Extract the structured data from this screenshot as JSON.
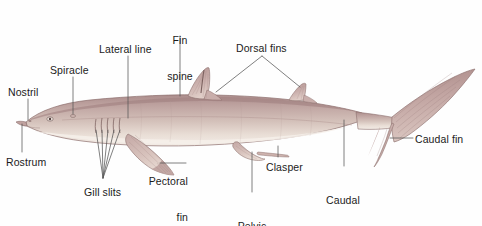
{
  "figure": {
    "background_color": "#fefefe",
    "label_color": "#1b1b1b",
    "leader_color": "#555555",
    "body_colors": {
      "dorsal": "#b79a98",
      "mid": "#c9b3ae",
      "ventral": "#efe7e0",
      "outline": "#8c6f6d",
      "fin": "#c3a6a3",
      "fin_shadow": "#a98b89"
    }
  },
  "labels": [
    {
      "id": "nostril",
      "text": "Nostril",
      "line2": "",
      "align": "left",
      "x": 8,
      "y": 86
    },
    {
      "id": "rostrum",
      "text": "Rostrum",
      "line2": "",
      "align": "left",
      "x": 6,
      "y": 156
    },
    {
      "id": "spiracle",
      "text": "Spiracle",
      "line2": "",
      "align": "left",
      "x": 50,
      "y": 64
    },
    {
      "id": "lateral-line",
      "text": "Lateral line",
      "line2": "",
      "align": "left",
      "x": 99,
      "y": 43
    },
    {
      "id": "gill-slits",
      "text": "Gill slits",
      "line2": "",
      "align": "center",
      "x": 84,
      "y": 186
    },
    {
      "id": "fin-spine",
      "text": "Fin",
      "line2": "spine",
      "align": "center",
      "x": 163,
      "y": 10
    },
    {
      "id": "dorsal-fins",
      "text": "Dorsal fins",
      "line2": "",
      "align": "left",
      "x": 236,
      "y": 42
    },
    {
      "id": "pectoral-fin",
      "text": "Pectoral",
      "line2": "fin",
      "align": "right",
      "x": 188,
      "y": 151
    },
    {
      "id": "pelvic-fin",
      "text": "Pelvic",
      "line2": "fin",
      "align": "center",
      "x": 243,
      "y": 196
    },
    {
      "id": "clasper",
      "text": "Clasper",
      "line2": "",
      "align": "left",
      "x": 266,
      "y": 161
    },
    {
      "id": "caudal-peduncle",
      "text": "Caudal",
      "line2": "peduncle",
      "align": "center",
      "x": 319,
      "y": 170
    },
    {
      "id": "caudal-fin",
      "text": "Caudal fin",
      "line2": "",
      "align": "left",
      "x": 415,
      "y": 134
    }
  ]
}
